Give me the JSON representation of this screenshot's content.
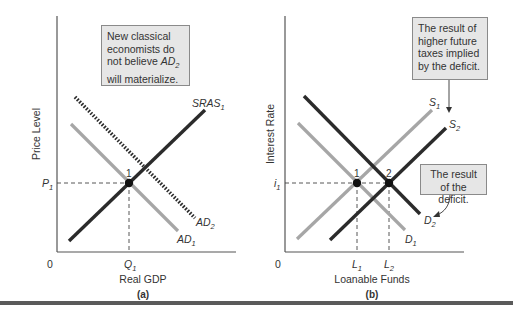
{
  "panels": {
    "a": {
      "label": "(a)",
      "y_axis_label": "Price Level",
      "x_axis_label": "Real GDP",
      "origin": "0",
      "price_tick": "P",
      "price_tick_sub": "1",
      "quantity_tick": "Q",
      "quantity_tick_sub": "1",
      "equilibrium_label": "1",
      "curves": {
        "sras": {
          "name": "SRAS",
          "sub": "1"
        },
        "ad1": {
          "name": "AD",
          "sub": "1"
        },
        "ad2": {
          "name": "AD",
          "sub": "2"
        }
      },
      "note": {
        "line1": "New classical",
        "line2": "economists do",
        "line3_prefix": "not believe ",
        "line3_curve": "AD",
        "line3_sub": "2",
        "line4": "will materialize."
      }
    },
    "b": {
      "label": "(b)",
      "y_axis_label": "Interest Rate",
      "x_axis_label": "Loanable Funds",
      "origin": "0",
      "rate_tick": "i",
      "rate_tick_sub": "1",
      "l1_tick": "L",
      "l1_sub": "1",
      "l2_tick": "L",
      "l2_sub": "2",
      "equilibrium_1_label": "1",
      "equilibrium_2_label": "2",
      "curves": {
        "s1": {
          "name": "S",
          "sub": "1"
        },
        "s2": {
          "name": "S",
          "sub": "2"
        },
        "d1": {
          "name": "D",
          "sub": "1"
        },
        "d2": {
          "name": "D",
          "sub": "2"
        }
      },
      "note_taxes": {
        "line1": "The result of",
        "line2": "higher future",
        "line3": "taxes implied",
        "line4": "by the deficit."
      },
      "note_deficit": {
        "line1": "The result",
        "line2": "of the deficit."
      }
    }
  },
  "colors": {
    "dark_curve": "#2b2b2b",
    "light_curve": "#a6a6a6",
    "axis": "#555555",
    "note_bg": "#e6e6e6"
  }
}
